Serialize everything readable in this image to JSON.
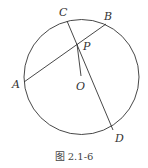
{
  "figure": {
    "caption": "图 2.1-6",
    "circle": {
      "cx": 81.5,
      "cy": 77,
      "r": 57.5,
      "stroke": "#333333"
    },
    "points": {
      "A": {
        "label": "A",
        "x": 24,
        "y": 82
      },
      "B": {
        "label": "B",
        "x": 106,
        "y": 24
      },
      "C": {
        "label": "C",
        "x": 67,
        "y": 21
      },
      "D": {
        "label": "D",
        "x": 113,
        "y": 130
      },
      "P": {
        "label": "P",
        "x": 77,
        "y": 44
      },
      "O": {
        "label": "O",
        "x": 81,
        "y": 76
      }
    },
    "segments": [
      {
        "from": "A",
        "to": "B",
        "name": "chord AB"
      },
      {
        "from": "C",
        "to": "D",
        "name": "chord CD"
      },
      {
        "from": "P",
        "to": "O",
        "name": "segment PO"
      }
    ]
  }
}
